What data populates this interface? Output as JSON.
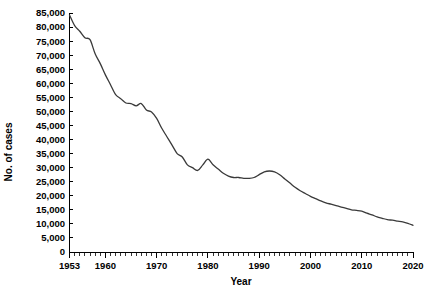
{
  "chart_data": {
    "type": "line",
    "title": "",
    "xlabel": "Year",
    "ylabel": "No. of cases",
    "xlim": [
      1953,
      2020
    ],
    "ylim": [
      0,
      85000
    ],
    "grid": false,
    "legend": null,
    "line_color": "#3a3a3a",
    "y_tick_labels": [
      "0",
      "5,000",
      "10,000",
      "15,000",
      "20,000",
      "25,000",
      "30,000",
      "35,000",
      "40,000",
      "45,000",
      "50,000",
      "55,000",
      "60,000",
      "65,000",
      "70,000",
      "75,000",
      "80,000",
      "85,000"
    ],
    "y_tick_values": [
      0,
      5000,
      10000,
      15000,
      20000,
      25000,
      30000,
      35000,
      40000,
      45000,
      50000,
      55000,
      60000,
      65000,
      70000,
      75000,
      80000,
      85000
    ],
    "x_tick_labels": [
      "1953",
      "1960",
      "1970",
      "1980",
      "1990",
      "2000",
      "2010",
      "2020"
    ],
    "x_tick_values": [
      1953,
      1960,
      1970,
      1980,
      1990,
      2000,
      2010,
      2020
    ],
    "x_minor_tick_step": 1,
    "series": [
      {
        "name": "No. of cases",
        "x": [
          1953,
          1954,
          1955,
          1956,
          1957,
          1958,
          1959,
          1960,
          1961,
          1962,
          1963,
          1964,
          1965,
          1966,
          1967,
          1968,
          1969,
          1970,
          1971,
          1972,
          1973,
          1974,
          1975,
          1976,
          1977,
          1978,
          1979,
          1980,
          1981,
          1982,
          1983,
          1984,
          1985,
          1986,
          1987,
          1988,
          1989,
          1990,
          1991,
          1992,
          1993,
          1994,
          1995,
          1996,
          1997,
          1998,
          1999,
          2000,
          2001,
          2002,
          2003,
          2004,
          2005,
          2006,
          2007,
          2008,
          2009,
          2010,
          2011,
          2012,
          2013,
          2014,
          2015,
          2016,
          2017,
          2018,
          2019,
          2020
        ],
        "values": [
          84300,
          80500,
          78500,
          76200,
          75500,
          70500,
          67000,
          63000,
          59500,
          56000,
          54500,
          53000,
          52800,
          52000,
          52800,
          50500,
          49800,
          47500,
          44000,
          41000,
          38000,
          35000,
          33800,
          31000,
          30000,
          29000,
          31000,
          33000,
          31000,
          29500,
          28000,
          27000,
          26500,
          26500,
          26200,
          26200,
          26500,
          27500,
          28500,
          28800,
          28500,
          27500,
          26000,
          24500,
          23000,
          21800,
          20800,
          19800,
          19000,
          18200,
          17500,
          17000,
          16500,
          16000,
          15500,
          15000,
          14800,
          14500,
          13800,
          13200,
          12500,
          12000,
          11500,
          11300,
          11000,
          10700,
          10200,
          9500
        ],
        "marker": "none",
        "linewidth": 1.3
      }
    ]
  },
  "axes_titles": {
    "y": "No. of cases",
    "x": "Year"
  }
}
